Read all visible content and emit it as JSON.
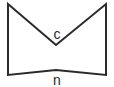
{
  "diagram": {
    "type": "polygon-figure",
    "stroke_color": "#2a2a2a",
    "background": "#ffffff",
    "vertices": [
      {
        "x": 8,
        "y": 4
      },
      {
        "x": 56,
        "y": 45
      },
      {
        "x": 106,
        "y": 4
      },
      {
        "x": 106,
        "y": 75
      },
      {
        "x": 56,
        "y": 70
      },
      {
        "x": 8,
        "y": 75
      }
    ],
    "labels": [
      {
        "id": "c",
        "text": "c",
        "x": 57,
        "y": 39
      },
      {
        "id": "n",
        "text": "n",
        "x": 57,
        "y": 85
      }
    ]
  }
}
